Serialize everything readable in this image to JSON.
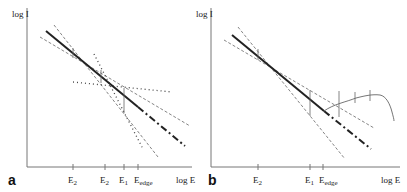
{
  "panels": [
    {
      "id": "a",
      "label": "a",
      "y_axis_label": "log I",
      "x_axis_label": "log E",
      "ticks": [
        {
          "main": "E",
          "sub": "2"
        },
        {
          "main": "E",
          "sub": "2"
        },
        {
          "main": "E",
          "sub": "1"
        },
        {
          "main": "E",
          "sub": "edge"
        }
      ]
    },
    {
      "id": "b",
      "label": "b",
      "y_axis_label": "log I",
      "x_axis_label": "log E",
      "ticks": [
        {
          "main": "E",
          "sub": "2"
        },
        {
          "main": "E",
          "sub": "1"
        },
        {
          "main": "E",
          "sub": "edge"
        }
      ]
    }
  ],
  "colors": {
    "axis": "#777777",
    "solid_line": "#222222",
    "dashed_line": "#666666",
    "dotted_line": "#444444",
    "curve": "#666666"
  }
}
